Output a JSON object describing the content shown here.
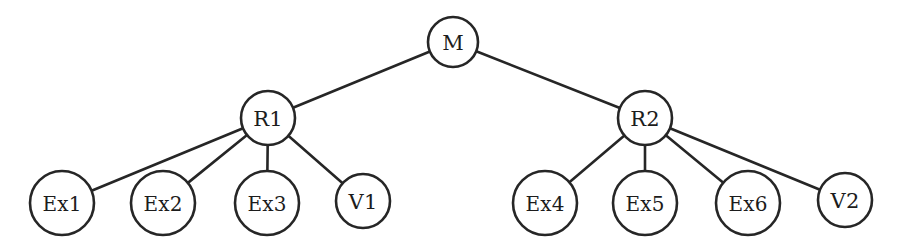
{
  "diagram": {
    "type": "tree",
    "title": "",
    "background_color": "#ffffff",
    "stroke_color": "#262626",
    "node_fill": "#ffffff",
    "label_color": "#1c1c1c",
    "nodes": [
      {
        "id": "M",
        "label": "M",
        "cx": 453,
        "cy": 42,
        "r": 25,
        "level": 0
      },
      {
        "id": "R1",
        "label": "R1",
        "cx": 268,
        "cy": 118,
        "r": 27,
        "level": 1
      },
      {
        "id": "R2",
        "label": "R2",
        "cx": 645,
        "cy": 118,
        "r": 27,
        "level": 1
      },
      {
        "id": "Ex1",
        "label": "Ex1",
        "cx": 62,
        "cy": 203,
        "r": 32,
        "level": 2
      },
      {
        "id": "Ex2",
        "label": "Ex2",
        "cx": 163,
        "cy": 203,
        "r": 32,
        "level": 2
      },
      {
        "id": "Ex3",
        "label": "Ex3",
        "cx": 267,
        "cy": 203,
        "r": 32,
        "level": 2
      },
      {
        "id": "V1",
        "label": "V1",
        "cx": 363,
        "cy": 201,
        "r": 27,
        "level": 2
      },
      {
        "id": "Ex4",
        "label": "Ex4",
        "cx": 545,
        "cy": 203,
        "r": 32,
        "level": 2
      },
      {
        "id": "Ex5",
        "label": "Ex5",
        "cx": 645,
        "cy": 203,
        "r": 32,
        "level": 2
      },
      {
        "id": "Ex6",
        "label": "Ex6",
        "cx": 748,
        "cy": 203,
        "r": 32,
        "level": 2
      },
      {
        "id": "V2",
        "label": "V2",
        "cx": 845,
        "cy": 200,
        "r": 27,
        "level": 2
      }
    ],
    "edges": [
      {
        "from": "M",
        "to": "R1"
      },
      {
        "from": "M",
        "to": "R2"
      },
      {
        "from": "R1",
        "to": "Ex1"
      },
      {
        "from": "R1",
        "to": "Ex2"
      },
      {
        "from": "R1",
        "to": "Ex3"
      },
      {
        "from": "R1",
        "to": "V1"
      },
      {
        "from": "R2",
        "to": "Ex4"
      },
      {
        "from": "R2",
        "to": "Ex5"
      },
      {
        "from": "R2",
        "to": "Ex6"
      },
      {
        "from": "R2",
        "to": "V2"
      }
    ]
  }
}
